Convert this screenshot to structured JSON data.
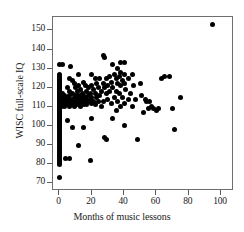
{
  "chart_data": {
    "type": "scatter",
    "title": "",
    "xlabel": "Months of music lessons",
    "ylabel": "WISC full-scale IQ",
    "xlim": [
      -4,
      108
    ],
    "ylim": [
      66,
      157
    ],
    "xticks": [
      0,
      20,
      40,
      60,
      80,
      100
    ],
    "yticks": [
      70,
      80,
      90,
      100,
      110,
      120,
      130,
      140,
      150
    ],
    "grid": false,
    "legend": null,
    "marker": {
      "shape": "circle",
      "color": "#000000",
      "size": 5
    },
    "frame_color": "#6e6e6e",
    "points": [
      [
        0,
        132
      ],
      [
        0,
        127
      ],
      [
        0,
        126
      ],
      [
        0,
        125
      ],
      [
        0,
        124
      ],
      [
        0,
        124
      ],
      [
        0,
        123
      ],
      [
        0,
        123
      ],
      [
        0,
        122
      ],
      [
        0,
        122
      ],
      [
        0,
        121
      ],
      [
        0,
        121
      ],
      [
        0,
        120
      ],
      [
        0,
        120
      ],
      [
        0,
        119
      ],
      [
        0,
        119
      ],
      [
        0,
        118
      ],
      [
        0,
        118
      ],
      [
        0,
        117
      ],
      [
        0,
        117
      ],
      [
        0,
        116
      ],
      [
        0,
        116
      ],
      [
        0,
        115
      ],
      [
        0,
        115
      ],
      [
        0,
        115
      ],
      [
        0,
        114
      ],
      [
        0,
        114
      ],
      [
        0,
        113
      ],
      [
        0,
        113
      ],
      [
        0,
        112
      ],
      [
        0,
        112
      ],
      [
        0,
        112
      ],
      [
        0,
        111
      ],
      [
        0,
        111
      ],
      [
        0,
        110
      ],
      [
        0,
        110
      ],
      [
        0,
        109
      ],
      [
        0,
        109
      ],
      [
        0,
        108
      ],
      [
        0,
        108
      ],
      [
        0,
        107
      ],
      [
        0,
        107
      ],
      [
        0,
        106
      ],
      [
        0,
        106
      ],
      [
        0,
        105
      ],
      [
        0,
        105
      ],
      [
        0,
        104
      ],
      [
        0,
        104
      ],
      [
        0,
        103
      ],
      [
        0,
        103
      ],
      [
        0,
        102
      ],
      [
        0,
        102
      ],
      [
        0,
        101
      ],
      [
        0,
        100
      ],
      [
        0,
        100
      ],
      [
        0,
        99
      ],
      [
        0,
        98
      ],
      [
        0,
        97
      ],
      [
        0,
        96
      ],
      [
        0,
        95
      ],
      [
        0,
        94
      ],
      [
        0,
        93
      ],
      [
        0,
        92
      ],
      [
        0,
        91
      ],
      [
        0,
        90
      ],
      [
        0,
        89
      ],
      [
        0,
        88
      ],
      [
        0,
        87
      ],
      [
        0,
        86
      ],
      [
        0,
        85
      ],
      [
        0,
        84
      ],
      [
        0,
        83
      ],
      [
        0,
        82
      ],
      [
        0,
        81
      ],
      [
        0,
        80
      ],
      [
        0,
        73
      ],
      [
        1,
        115
      ],
      [
        1,
        114
      ],
      [
        1,
        112
      ],
      [
        1,
        110
      ],
      [
        2,
        132
      ],
      [
        2,
        117
      ],
      [
        2,
        113
      ],
      [
        2,
        111
      ],
      [
        3,
        116
      ],
      [
        3,
        114
      ],
      [
        3,
        112
      ],
      [
        3,
        110
      ],
      [
        4,
        83
      ],
      [
        5,
        120
      ],
      [
        5,
        115
      ],
      [
        5,
        113
      ],
      [
        5,
        111
      ],
      [
        5,
        103
      ],
      [
        6,
        125
      ],
      [
        6,
        118
      ],
      [
        6,
        116
      ],
      [
        6,
        113
      ],
      [
        6,
        110
      ],
      [
        6,
        83
      ],
      [
        7,
        131
      ],
      [
        7,
        114
      ],
      [
        7,
        112
      ],
      [
        8,
        124
      ],
      [
        8,
        117
      ],
      [
        8,
        113
      ],
      [
        8,
        111
      ],
      [
        8,
        99
      ],
      [
        9,
        122
      ],
      [
        9,
        115
      ],
      [
        9,
        112
      ],
      [
        9,
        110
      ],
      [
        10,
        120
      ],
      [
        10,
        116
      ],
      [
        10,
        113
      ],
      [
        10,
        111
      ],
      [
        11,
        118
      ],
      [
        11,
        114
      ],
      [
        11,
        112
      ],
      [
        12,
        127
      ],
      [
        12,
        121
      ],
      [
        12,
        116
      ],
      [
        12,
        113
      ],
      [
        12,
        111
      ],
      [
        12,
        90
      ],
      [
        13,
        119
      ],
      [
        13,
        115
      ],
      [
        13,
        112
      ],
      [
        13,
        110
      ],
      [
        14,
        117
      ],
      [
        14,
        114
      ],
      [
        14,
        112
      ],
      [
        15,
        123
      ],
      [
        15,
        116
      ],
      [
        15,
        113
      ],
      [
        15,
        111
      ],
      [
        15,
        99
      ],
      [
        16,
        121
      ],
      [
        16,
        115
      ],
      [
        16,
        112
      ],
      [
        17,
        118
      ],
      [
        17,
        114
      ],
      [
        17,
        111
      ],
      [
        18,
        120
      ],
      [
        18,
        116
      ],
      [
        18,
        113
      ],
      [
        19,
        117
      ],
      [
        19,
        114
      ],
      [
        19,
        82
      ],
      [
        20,
        127
      ],
      [
        20,
        121
      ],
      [
        20,
        115
      ],
      [
        20,
        112
      ],
      [
        20,
        104
      ],
      [
        21,
        119
      ],
      [
        21,
        113
      ],
      [
        22,
        125
      ],
      [
        22,
        117
      ],
      [
        22,
        111
      ],
      [
        23,
        122
      ],
      [
        23,
        115
      ],
      [
        24,
        120
      ],
      [
        24,
        113
      ],
      [
        25,
        125
      ],
      [
        25,
        116
      ],
      [
        26,
        118
      ],
      [
        26,
        110
      ],
      [
        27,
        137
      ],
      [
        27,
        122
      ],
      [
        27,
        113
      ],
      [
        28,
        136
      ],
      [
        28,
        120
      ],
      [
        28,
        94
      ],
      [
        29,
        125
      ],
      [
        29,
        117
      ],
      [
        29,
        93
      ],
      [
        30,
        121
      ],
      [
        30,
        114
      ],
      [
        31,
        126
      ],
      [
        31,
        118
      ],
      [
        32,
        123
      ],
      [
        32,
        112
      ],
      [
        33,
        132
      ],
      [
        33,
        120
      ],
      [
        33,
        104
      ],
      [
        34,
        127
      ],
      [
        34,
        115
      ],
      [
        35,
        125
      ],
      [
        35,
        118
      ],
      [
        35,
        108
      ],
      [
        36,
        130
      ],
      [
        36,
        122
      ],
      [
        36,
        113
      ],
      [
        37,
        126
      ],
      [
        37,
        117
      ],
      [
        38,
        133
      ],
      [
        38,
        128
      ],
      [
        38,
        121
      ],
      [
        38,
        110
      ],
      [
        39,
        124
      ],
      [
        39,
        115
      ],
      [
        40,
        133
      ],
      [
        40,
        127
      ],
      [
        40,
        122
      ],
      [
        40,
        112
      ],
      [
        40,
        100
      ],
      [
        41,
        119
      ],
      [
        43,
        125
      ],
      [
        43,
        114
      ],
      [
        44,
        117
      ],
      [
        45,
        127
      ],
      [
        45,
        110
      ],
      [
        46,
        121
      ],
      [
        47,
        114
      ],
      [
        48,
        93
      ],
      [
        50,
        122
      ],
      [
        51,
        116
      ],
      [
        52,
        107
      ],
      [
        53,
        114
      ],
      [
        54,
        113
      ],
      [
        55,
        109
      ],
      [
        56,
        113
      ],
      [
        57,
        110
      ],
      [
        58,
        109
      ],
      [
        60,
        108
      ],
      [
        61,
        109
      ],
      [
        63,
        125
      ],
      [
        65,
        126
      ],
      [
        68,
        126
      ],
      [
        70,
        109
      ],
      [
        71,
        98
      ],
      [
        75,
        115
      ],
      [
        95,
        153
      ]
    ]
  },
  "axes": {
    "x_tick_labels": [
      "0",
      "20",
      "40",
      "60",
      "80",
      "100"
    ],
    "y_tick_labels": [
      "70",
      "80",
      "90",
      "100",
      "110",
      "120",
      "130",
      "140",
      "150"
    ],
    "x_axis_title": "Months of music lessons",
    "y_axis_title": "WISC full-scale IQ"
  }
}
